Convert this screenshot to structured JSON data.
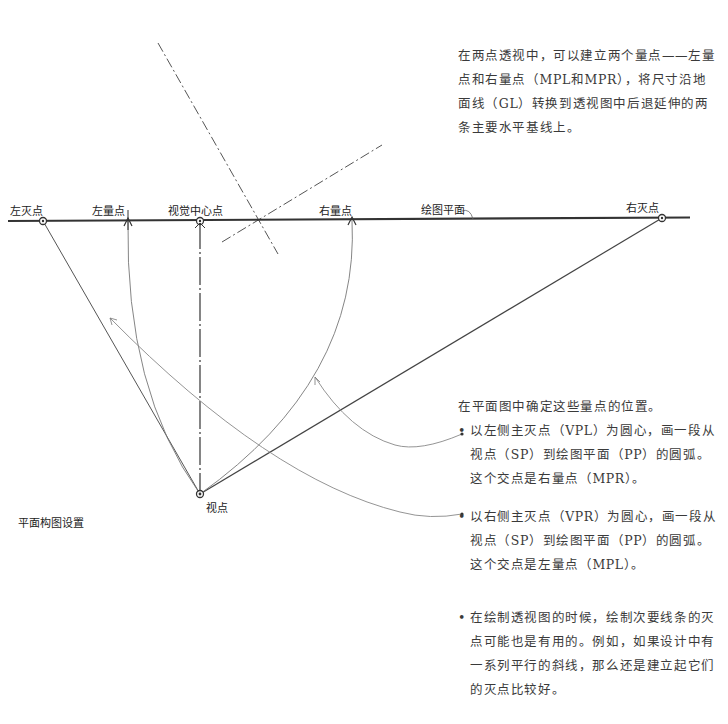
{
  "diagram": {
    "labels": {
      "left_vanishing_point": "左灭点",
      "left_measuring_point": "左量点",
      "center_of_vision": "视觉中心点",
      "right_measuring_point": "右量点",
      "picture_plane": "绘图平面",
      "right_vanishing_point": "右灭点",
      "station_point": "视点",
      "plan_setup": "平面构图设置"
    },
    "colors": {
      "line": "#3a3a3a",
      "thin_line": "#8a8a8a",
      "text": "#3a3a3a",
      "background": "#ffffff"
    },
    "points": {
      "left_vp": [
        43,
        221
      ],
      "left_mp": [
        128,
        221
      ],
      "center_of_vision": [
        200,
        221
      ],
      "right_mp": [
        352,
        220
      ],
      "right_vp": [
        662,
        218
      ],
      "station_point": [
        200,
        494
      ]
    }
  },
  "text": {
    "intro": "在两点透视中，可以建立两个量点——左量点和右量点（MPL和MPR），将尺寸沿地面线（GL）转换到透视图中后退延伸的两条主要水平基线上。",
    "steps_lead": "在平面图中确定这些量点的位置。",
    "bullet_mark": "•",
    "step1": "以左侧主灭点（VPL）为圆心，画一段从视点（SP）到绘图平面（PP）的圆弧。这个交点是右量点（MPR）。",
    "step2": "以右侧主灭点（VPR）为圆心，画一段从视点（SP）到绘图平面（PP）的圆弧。这个交点是左量点（MPL）。",
    "tip": "在绘制透视图的时候，绘制次要线条的灭点可能也是有用的。例如，如果设计中有一系列平行的斜线，那么还是建立起它们的灭点比较好。"
  }
}
